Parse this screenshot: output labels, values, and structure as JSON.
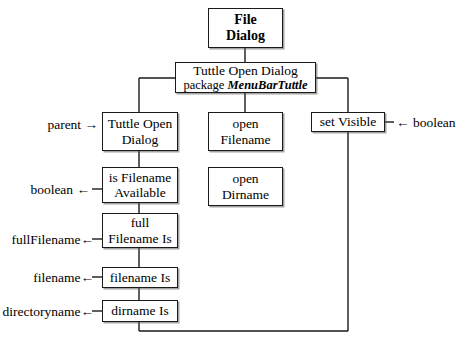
{
  "diagram": {
    "nodes": {
      "file_dialog": {
        "line1": "File",
        "line2": "Dialog"
      },
      "tuttle_open_dialog_class": {
        "line1": "Tuttle Open Dialog",
        "line2_prefix": "package ",
        "line2_em": "MenuBarTuttle"
      },
      "tuttle_open_dialog_ctor": {
        "line1": "Tuttle Open",
        "line2": "Dialog"
      },
      "is_filename_available": {
        "line1": "is Filename",
        "line2": "Available"
      },
      "full_filename_is": {
        "line1": "full",
        "line2": "Filename Is"
      },
      "filename_is": {
        "line1": "filename Is"
      },
      "dirname_is": {
        "line1": "dirname Is"
      },
      "open_filename": {
        "line1": "open",
        "line2": "Filename"
      },
      "open_dirname": {
        "line1": "open",
        "line2": "Dirname"
      },
      "set_visible": {
        "line1": "set Visible"
      }
    },
    "labels": {
      "parent_in": "parent →",
      "boolean_out": "boolean ←",
      "fullfilename_out": "fullFilename←",
      "filename_out": "filename←",
      "directoryname_out": "directoryname←",
      "boolean_in": "← boolean"
    },
    "colors": {
      "stroke": "#1a1a1a",
      "background": "#ffffff",
      "text": "#000000",
      "shadow": "#5a5a5a"
    }
  }
}
